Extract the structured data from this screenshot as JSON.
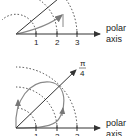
{
  "diagrams": [
    {
      "id": "top",
      "axis_label_line1": "polar",
      "axis_label_line2": "axis",
      "ticks": [
        "1",
        "2",
        "3"
      ]
    },
    {
      "id": "bottom",
      "axis_label_line1": "polar",
      "axis_label_line2": "axis",
      "ticks": [
        "1",
        "2",
        "3"
      ],
      "ray_label_num": "π",
      "ray_label_den": "4"
    }
  ],
  "colors": {
    "axis": "#333333",
    "curve": "#888888",
    "dotted": "#444444"
  }
}
